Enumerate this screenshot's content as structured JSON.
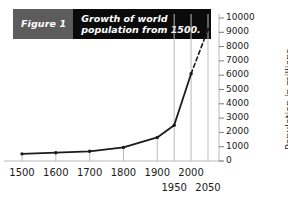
{
  "title": {
    "figure_label": "Figure 1",
    "line1": "Growth of world",
    "line2": "population from 1500.",
    "figure_bg": "#5c5c5c",
    "main_bg": "#0b0b0b",
    "text_color": "#ffffff"
  },
  "chart_data": {
    "type": "line",
    "title": "Growth of world population from 1500.",
    "xlabel": "",
    "ylabel": "Population in millions",
    "xlim": [
      1500,
      2050
    ],
    "ylim": [
      0,
      10000
    ],
    "grid": "vertical-only",
    "legend": "none",
    "x": [
      1500,
      1600,
      1700,
      1800,
      1900,
      1950,
      2000,
      2050
    ],
    "values": [
      500,
      580,
      680,
      950,
      1650,
      2500,
      6100,
      9200
    ],
    "xticks": [
      1500,
      1600,
      1700,
      1800,
      1900,
      1950,
      2000,
      2050
    ],
    "xtick_labels": [
      "1500",
      "1600",
      "1700",
      "1800",
      "1900",
      "1950",
      "2000",
      "2050"
    ],
    "xtick_rows": [
      0,
      0,
      0,
      0,
      0,
      1,
      0,
      1
    ],
    "yticks": [
      0,
      1000,
      2000,
      3000,
      4000,
      5000,
      6000,
      7000,
      8000,
      9000,
      10000
    ],
    "ytick_labels": [
      "0",
      "1000",
      "2000",
      "3000",
      "4000",
      "5000",
      "6000",
      "7000",
      "8000",
      "9000",
      "10000"
    ],
    "gridlines_x": [
      1950,
      2000,
      2050
    ],
    "segments": [
      {
        "from": 1500,
        "to": 2000,
        "style": "solid",
        "note": "observed"
      },
      {
        "from": 2000,
        "to": 2050,
        "style": "dashed",
        "note": "projection"
      }
    ],
    "markers": [
      1500,
      1600,
      1700,
      1800,
      1900,
      1950,
      2000,
      2050
    ],
    "line_color": "#1a1a1a",
    "grid_color": "#b9b9b9",
    "axis_color": "#b9b9b9"
  },
  "axis": {
    "ylabel_text": "Population in millions"
  }
}
